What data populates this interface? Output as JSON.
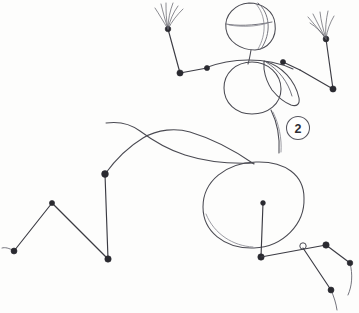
{
  "drawing": {
    "medium": "pencil sketch",
    "subject": "gesture figure construction study",
    "background_color": "#fdfdfc",
    "line_color": "#4a4a52",
    "joint_color": "#2a2a30",
    "canvas": {
      "width": 359,
      "height": 313
    }
  },
  "annotations": [
    {
      "name": "step-number-2",
      "text": "2",
      "shape": "circle",
      "center_x": 298,
      "center_y": 128,
      "radius": 11.5,
      "ring_color": "#55555e",
      "text_color": "#2e2e34"
    }
  ],
  "figure": {
    "parts": [
      {
        "name": "head",
        "kind": "construction-sphere",
        "cx": 250,
        "cy": 25,
        "rx": 24,
        "ry": 26,
        "note": "oval with vertical arc and horizontal equator line"
      },
      {
        "name": "neck",
        "kind": "line",
        "note": "short line from head base to shoulder line"
      },
      {
        "name": "shoulder-line",
        "kind": "curve",
        "note": "arched line across upper torso with two joint dots"
      },
      {
        "name": "chest",
        "kind": "construction-circle",
        "cx": 252,
        "cy": 88,
        "rx": 28,
        "ry": 26
      },
      {
        "name": "chest-overlap",
        "kind": "crescent",
        "note": "overlapping crescent mass on right of chest circle"
      },
      {
        "name": "spine",
        "kind": "curve",
        "note": "connects chest mass down to pelvis oval"
      },
      {
        "name": "pelvis",
        "kind": "construction-oval",
        "cx": 253,
        "cy": 205,
        "rx": 50,
        "ry": 43
      },
      {
        "name": "pelvis-center-line",
        "kind": "bone",
        "note": "vertical bone inside pelvis with joint dots at both ends"
      },
      {
        "name": "left-arm",
        "kind": "bone-chain",
        "joints": [
          "shoulder",
          "elbow",
          "wrist"
        ]
      },
      {
        "name": "left-hand",
        "kind": "splayed-fingers",
        "count": 6
      },
      {
        "name": "right-arm",
        "kind": "bone-chain",
        "joints": [
          "shoulder",
          "elbow",
          "wrist"
        ]
      },
      {
        "name": "right-hand",
        "kind": "splayed-fingers",
        "count": 6
      },
      {
        "name": "left-leg",
        "kind": "bone-chain-zigzag",
        "joints": [
          "hip",
          "knee",
          "ankle",
          "foot"
        ]
      },
      {
        "name": "right-leg",
        "kind": "bone-chain",
        "joints": [
          "hip",
          "knee",
          "ankle",
          "foot"
        ]
      },
      {
        "name": "back-contour",
        "kind": "curve",
        "note": "long sweeping curve from upper left to pelvis"
      }
    ],
    "joint_count": 14
  }
}
